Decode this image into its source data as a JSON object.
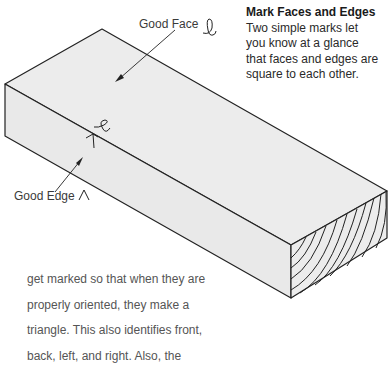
{
  "caption": {
    "title": "Mark Faces and Edges",
    "lines": [
      "Two simple marks let",
      "you know at a glance",
      "that faces and edges are",
      "square to each other."
    ]
  },
  "labels": {
    "good_face": "Good Face",
    "good_edge": "Good Edge"
  },
  "icons": {
    "face_mark": "cursive-l-loop-mark",
    "edge_mark": "caret-triangle-mark"
  },
  "body_text": {
    "lines": [
      "get marked so that when they are",
      "properly oriented, they make a",
      "triangle. This also identifies front,",
      "back, left, and right. Also, the"
    ]
  },
  "colors": {
    "board_face": "#ededed",
    "outline": "#222222",
    "caption_text": "#2a2a2a",
    "body_text": "#555555"
  }
}
